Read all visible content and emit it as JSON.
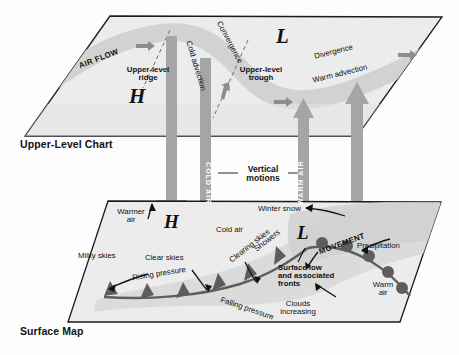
{
  "diagram": {
    "title_upper": "Upper-Level Chart",
    "title_surface": "Surface Map",
    "colors": {
      "plane_fill": "#ececec",
      "jet_band": "#d2d2d2",
      "arrow_gray": "#9a9a9a",
      "front_gray": "#6e6e6e",
      "precip_shade": "#c4c4c4",
      "ink": "#111111"
    }
  },
  "upper_level": {
    "air_flow": "AIR FLOW",
    "ridge": "Upper-level\nridge",
    "trough": "Upper-level\ntrough",
    "high_symbol": "H",
    "low_symbol": "L",
    "cold_advection": "Cold advection",
    "warm_advection": "Warm advection",
    "convergence": "Convergence",
    "divergence": "Divergence"
  },
  "middle": {
    "vertical_motions": "Vertical\nmotions",
    "cold_air_column": "COLD AIR",
    "warm_air_column": "WARM AIR"
  },
  "surface": {
    "warmer_air": "Warmer\nair",
    "milky_skies": "Milky skies",
    "clear_skies": "Clear skies",
    "rising_pressure": "Rising pressure",
    "high_symbol": "H",
    "cold_air": "Cold air",
    "clearing_skies": "Clearing skies",
    "showers": "Showers",
    "falling_pressure": "Falling pressure",
    "winter_snow": "Winter snow",
    "low_symbol": "L",
    "movement": "MOVEMENT",
    "precipitation": "Precipitation",
    "surface_low": "Surface low\nand associated\nfronts",
    "warm_air": "Warm\nair",
    "clouds_increasing": "Clouds\nincreasing"
  }
}
